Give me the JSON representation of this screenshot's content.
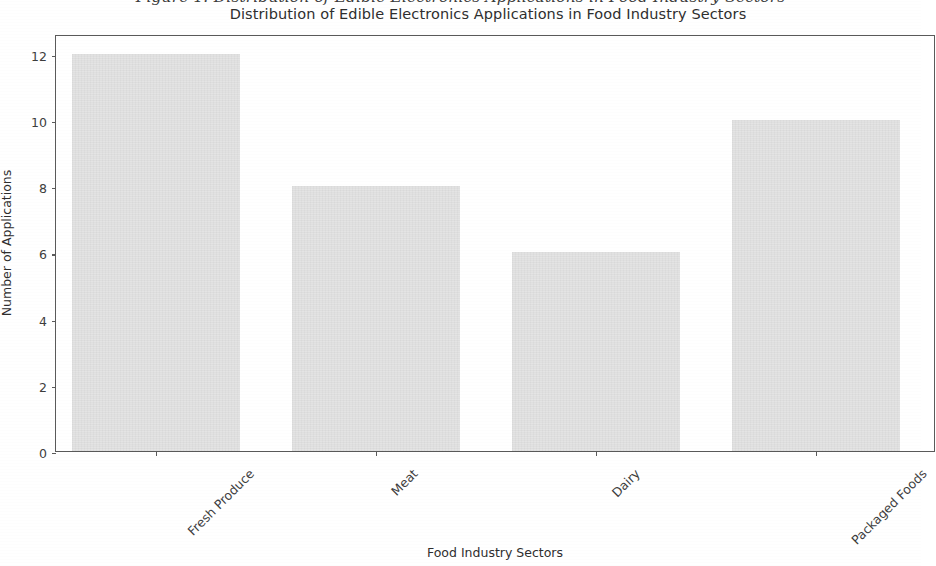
{
  "figure_caption": "Figure 1: Distribution of Edible Electronics Applications in Food Industry Sectors",
  "chart_data": {
    "type": "bar",
    "title": "Distribution of Edible Electronics Applications in Food Industry Sectors",
    "xlabel": "Food Industry Sectors",
    "ylabel": "Number of Applications",
    "categories": [
      "Fresh Produce",
      "Meat",
      "Dairy",
      "Packaged Foods"
    ],
    "values": [
      12,
      8,
      6,
      10
    ],
    "yticks": [
      0,
      2,
      4,
      6,
      8,
      10,
      12
    ],
    "ylim": [
      0,
      12.6
    ],
    "grid": false,
    "legend": null,
    "bar_color": "#e4e4e4",
    "axis_color": "#5a5a5a",
    "text_color": "#2e2e2e",
    "xtick_rotation": -45
  }
}
